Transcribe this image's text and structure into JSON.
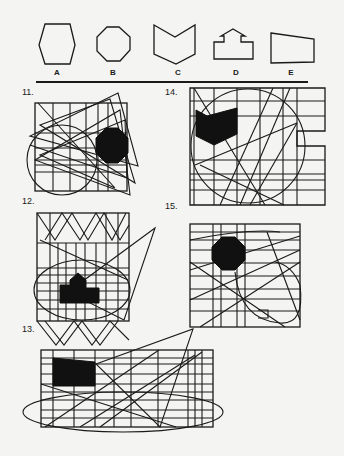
{
  "answer_choices": [
    {
      "label": "A",
      "shape": "hexagon",
      "x": 57
    },
    {
      "label": "B",
      "shape": "octagon",
      "x": 113
    },
    {
      "label": "C",
      "shape": "chevron-pentagon",
      "x": 178
    },
    {
      "label": "D",
      "shape": "arrow-house",
      "x": 236
    },
    {
      "label": "E",
      "shape": "trapezoid",
      "x": 291
    }
  ],
  "questions": [
    {
      "number": "11.",
      "hidden_shape": "B"
    },
    {
      "number": "12.",
      "hidden_shape": "D"
    },
    {
      "number": "13.",
      "hidden_shape": "E"
    },
    {
      "number": "14.",
      "hidden_shape": "C"
    },
    {
      "number": "15.",
      "hidden_shape": "B"
    }
  ],
  "colors": {
    "ink": "#1a1a1a",
    "paper": "#f4f4f2"
  }
}
